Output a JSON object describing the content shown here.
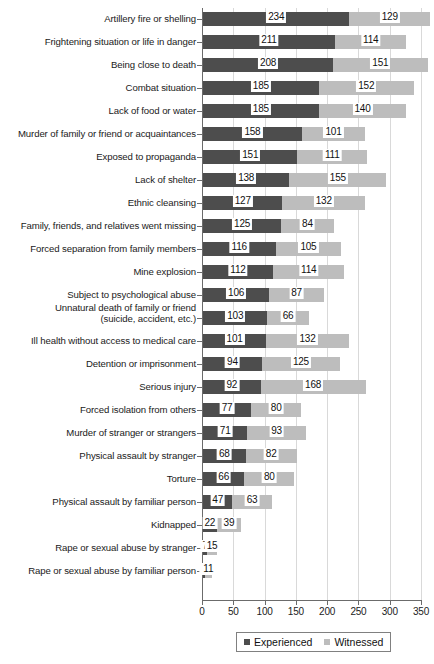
{
  "chart_data": {
    "type": "bar",
    "orientation": "horizontal",
    "stacked": true,
    "title": "",
    "subtitle": "",
    "xlabel": "",
    "ylabel": "",
    "xlim": [
      0,
      350
    ],
    "xticks": [
      0,
      50,
      100,
      150,
      200,
      250,
      300,
      350
    ],
    "xticklabels": [
      "0",
      "50",
      "100",
      "150",
      "200",
      "250",
      "300",
      "350"
    ],
    "grid": true,
    "grid_axis": "x",
    "legend": {
      "position": "bottom-right",
      "entries": [
        {
          "name": "Experienced",
          "color": "#4d4d4d"
        },
        {
          "name": "Witnessed",
          "color": "#bdbdbd"
        }
      ]
    },
    "categories": [
      "Artillery fire or shelling",
      "Frightening situation or life in danger",
      "Being close to death",
      "Combat situation",
      "Lack of food or water",
      "Murder of family or friend or acquaintances",
      "Exposed to propaganda",
      "Lack of shelter",
      "Ethnic cleansing",
      "Family, friends, and relatives went missing",
      "Forced separation from family members",
      "Mine explosion",
      "Subject to psychological abuse",
      "Unnatural death of family or friend\n(suicide, accident, etc.)",
      "Ill health without access to medical care",
      "Detention or imprisonment",
      "Serious injury",
      "Forced isolation from others",
      "Murder of stranger or strangers",
      "Physical assault by stranger",
      "Torture",
      "Physical assault by familiar person",
      "Kidnapped",
      "Rape or sexual abuse by stranger",
      "Rape or sexual abuse by familiar person"
    ],
    "series": [
      {
        "name": "Experienced",
        "color": "#4d4d4d",
        "values": [
          234,
          211,
          208,
          185,
          185,
          158,
          151,
          138,
          127,
          125,
          116,
          112,
          106,
          103,
          101,
          94,
          92,
          77,
          71,
          68,
          66,
          47,
          22,
          7,
          3
        ]
      },
      {
        "name": "Witnessed",
        "color": "#bdbdbd",
        "values": [
          129,
          114,
          151,
          152,
          140,
          101,
          111,
          155,
          132,
          84,
          105,
          114,
          87,
          66,
          132,
          125,
          168,
          80,
          93,
          82,
          80,
          63,
          39,
          15,
          11
        ]
      }
    ]
  }
}
